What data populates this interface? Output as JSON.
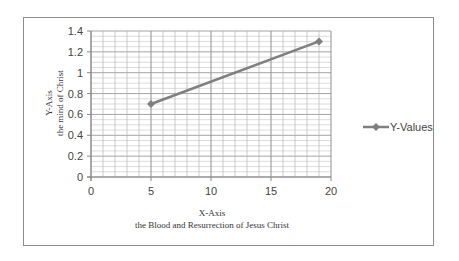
{
  "chart_data": {
    "type": "scatter",
    "title": "",
    "xlabel": "X-Axis",
    "xlabel_sub": "the Blood and Resurrection of Jesus Christ",
    "ylabel": "Y-Axis",
    "ylabel_sub": "the mind of Christ",
    "xlim": [
      0,
      20
    ],
    "ylim": [
      0,
      1.4
    ],
    "x_ticks": [
      "0",
      "5",
      "10",
      "15",
      "20"
    ],
    "y_ticks": [
      "0",
      "0.2",
      "0.4",
      "0.6",
      "0.8",
      "1",
      "1.2",
      "1.4"
    ],
    "grid": true,
    "legend_position": "right",
    "series": [
      {
        "name": "Y-Values",
        "color": "#7f7f7f",
        "marker": "diamond",
        "line": true,
        "points": [
          {
            "x": 5,
            "y": 0.7
          },
          {
            "x": 19,
            "y": 1.3
          }
        ]
      }
    ]
  },
  "legend": {
    "label": "Y-Values"
  }
}
